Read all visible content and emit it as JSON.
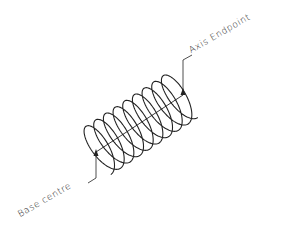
{
  "diagram": {
    "type": "helix",
    "labels": {
      "axis_endpoint": "Axis Endpoint",
      "base_centre": "Base centre"
    },
    "colors": {
      "line": "#222222",
      "background": "#ffffff"
    },
    "helix": {
      "turns": 9,
      "base_center": [
        96,
        152
      ],
      "axis_end": [
        183,
        95
      ],
      "radius": 27
    }
  }
}
